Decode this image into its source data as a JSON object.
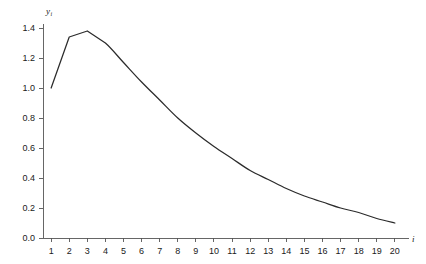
{
  "chart_data": {
    "type": "line",
    "title": "",
    "xlabel": "i",
    "ylabel": "y_i",
    "ylabel_base": "y",
    "ylabel_sub": "i",
    "x": [
      1,
      2,
      3,
      4,
      5,
      6,
      7,
      8,
      9,
      10,
      11,
      12,
      13,
      14,
      15,
      16,
      17,
      18,
      19,
      20
    ],
    "values": [
      1.0,
      1.34,
      1.38,
      1.3,
      1.17,
      1.04,
      0.92,
      0.8,
      0.7,
      0.61,
      0.53,
      0.45,
      0.39,
      0.33,
      0.28,
      0.24,
      0.2,
      0.17,
      0.13,
      0.1
    ],
    "series": [
      {
        "name": "y_i",
        "values": [
          1.0,
          1.34,
          1.38,
          1.3,
          1.17,
          1.04,
          0.92,
          0.8,
          0.7,
          0.61,
          0.53,
          0.45,
          0.39,
          0.33,
          0.28,
          0.24,
          0.2,
          0.17,
          0.13,
          0.1
        ]
      }
    ],
    "xlim": [
      0.55,
      20.45
    ],
    "ylim": [
      0.0,
      1.44
    ],
    "xticks": [
      1,
      2,
      3,
      4,
      5,
      6,
      7,
      8,
      9,
      10,
      11,
      12,
      13,
      14,
      15,
      16,
      17,
      18,
      19,
      20
    ],
    "xtick_labels": [
      "1",
      "2",
      "3",
      "4",
      "5",
      "6",
      "7",
      "8",
      "9",
      "10",
      "11",
      "12",
      "13",
      "14",
      "15",
      "16",
      "17",
      "18",
      "19",
      "20"
    ],
    "yticks": [
      0.0,
      0.2,
      0.4,
      0.6,
      0.8,
      1.0,
      1.2,
      1.4
    ],
    "ytick_labels": [
      "0.0",
      "0.2",
      "0.4",
      "0.6",
      "0.8",
      "1.0",
      "1.2",
      "1.4"
    ],
    "grid": false,
    "legend": false,
    "legend_position": "none",
    "line_color": "#2b2b2b",
    "axis_color": "#555555",
    "background_color": "#ffffff"
  }
}
